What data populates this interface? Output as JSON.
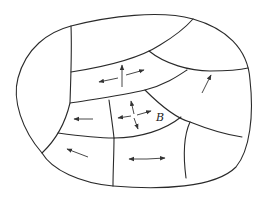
{
  "diagram": {
    "type": "plate-map",
    "colors": {
      "stroke": "#2a2a2a",
      "background": "#ffffff"
    },
    "labels": [
      {
        "id": "B",
        "text": "B"
      }
    ],
    "arrows": [
      {
        "region": "upper-middle-band",
        "kind": "cross",
        "directions": [
          "up",
          "left",
          "right"
        ]
      },
      {
        "region": "right-band",
        "kind": "single",
        "directions": [
          "up-right"
        ]
      },
      {
        "region": "left-middle",
        "kind": "single",
        "directions": [
          "left"
        ]
      },
      {
        "region": "center-B",
        "kind": "cross",
        "directions": [
          "up",
          "down",
          "left",
          "right"
        ]
      },
      {
        "region": "lower-left",
        "kind": "single",
        "directions": [
          "up-left"
        ]
      },
      {
        "region": "lower-middle",
        "kind": "double",
        "directions": [
          "left",
          "right"
        ]
      }
    ]
  }
}
